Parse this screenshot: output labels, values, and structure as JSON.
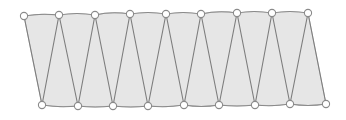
{
  "figure": {
    "canvas": {
      "width": 346,
      "height": 120,
      "background": "#ffffff"
    },
    "colors": {
      "fill": "#e6e6e6",
      "fill_edge": "#b5b5b5",
      "chord_stroke": "#8a8a8a",
      "web_stroke": "#7d7d7d",
      "node_stroke": "#8a8a8a",
      "node_fill": "#ffffff"
    },
    "style": {
      "chord_width": 1.1,
      "web_width": 1.1,
      "node_radius": 3.6,
      "node_stroke_width": 1.1
    },
    "counts": {
      "top_nodes": 9,
      "bottom_nodes": 9,
      "web_members": 17,
      "top_chord_segments": 8,
      "bottom_chord_segments": 8
    },
    "top_nodes": [
      {
        "id": "T1",
        "x": 24,
        "y": 16
      },
      {
        "id": "T2",
        "x": 59,
        "y": 15
      },
      {
        "id": "T3",
        "x": 95,
        "y": 15
      },
      {
        "id": "T4",
        "x": 130,
        "y": 14
      },
      {
        "id": "T5",
        "x": 166,
        "y": 14
      },
      {
        "id": "T6",
        "x": 201,
        "y": 14
      },
      {
        "id": "T7",
        "x": 237,
        "y": 13
      },
      {
        "id": "T8",
        "x": 272,
        "y": 13
      },
      {
        "id": "T9",
        "x": 308,
        "y": 13
      }
    ],
    "bottom_nodes": [
      {
        "id": "B1",
        "x": 42,
        "y": 105
      },
      {
        "id": "B2",
        "x": 78,
        "y": 106
      },
      {
        "id": "B3",
        "x": 113,
        "y": 106
      },
      {
        "id": "B4",
        "x": 148,
        "y": 106
      },
      {
        "id": "B5",
        "x": 184,
        "y": 105
      },
      {
        "id": "B6",
        "x": 219,
        "y": 105
      },
      {
        "id": "B7",
        "x": 255,
        "y": 105
      },
      {
        "id": "B8",
        "x": 290,
        "y": 104
      },
      {
        "id": "B9",
        "x": 326,
        "y": 104
      }
    ],
    "top_chord_path": "M 24 16 Q 41 13 59 15 Q 77 12 95 15 Q 112 11 130 14 Q 148 11 166 14 Q 183 11 201 14 Q 219 10 237 13 Q 254 10 272 13 Q 290 10 308 13",
    "bottom_chord_path": "M 42 105 Q 60 108 78 106 Q 95 108 113 106 Q 131 108 148 106 Q 166 108 184 105 Q 201 108 219 105 Q 237 107 255 105 Q 272 107 290 104 Q 308 107 326 104",
    "body_fill_path": "M 24 16 Q 41 13 59 15 Q 77 12 95 15 Q 112 11 130 14 Q 148 11 166 14 Q 183 11 201 14 Q 219 10 237 13 Q 254 10 272 13 Q 290 10 308 13 L 326 104 Q 308 107 290 104 Q 272 107 255 105 Q 237 107 219 105 Q 201 108 184 105 Q 166 108 148 106 Q 131 108 113 106 Q 95 108 78 106 Q 60 108 42 105 Z",
    "web_members": [
      {
        "id": "W1",
        "from": "T1",
        "to": "B1",
        "x1": 24,
        "y1": 16,
        "x2": 42,
        "y2": 105
      },
      {
        "id": "W2",
        "from": "T2",
        "to": "B1",
        "x1": 59,
        "y1": 15,
        "x2": 42,
        "y2": 105
      },
      {
        "id": "W3",
        "from": "T2",
        "to": "B2",
        "x1": 59,
        "y1": 15,
        "x2": 78,
        "y2": 106
      },
      {
        "id": "W4",
        "from": "T3",
        "to": "B2",
        "x1": 95,
        "y1": 15,
        "x2": 78,
        "y2": 106
      },
      {
        "id": "W5",
        "from": "T3",
        "to": "B3",
        "x1": 95,
        "y1": 15,
        "x2": 113,
        "y2": 106
      },
      {
        "id": "W6",
        "from": "T4",
        "to": "B3",
        "x1": 130,
        "y1": 14,
        "x2": 113,
        "y2": 106
      },
      {
        "id": "W7",
        "from": "T4",
        "to": "B4",
        "x1": 130,
        "y1": 14,
        "x2": 148,
        "y2": 106
      },
      {
        "id": "W8",
        "from": "T5",
        "to": "B4",
        "x1": 166,
        "y1": 14,
        "x2": 148,
        "y2": 106
      },
      {
        "id": "W9",
        "from": "T5",
        "to": "B5",
        "x1": 166,
        "y1": 14,
        "x2": 184,
        "y2": 105
      },
      {
        "id": "W10",
        "from": "T6",
        "to": "B5",
        "x1": 201,
        "y1": 14,
        "x2": 184,
        "y2": 105
      },
      {
        "id": "W11",
        "from": "T6",
        "to": "B6",
        "x1": 201,
        "y1": 14,
        "x2": 219,
        "y2": 105
      },
      {
        "id": "W12",
        "from": "T7",
        "to": "B6",
        "x1": 237,
        "y1": 13,
        "x2": 219,
        "y2": 105
      },
      {
        "id": "W13",
        "from": "T7",
        "to": "B7",
        "x1": 237,
        "y1": 13,
        "x2": 255,
        "y2": 105
      },
      {
        "id": "W14",
        "from": "T8",
        "to": "B7",
        "x1": 272,
        "y1": 13,
        "x2": 255,
        "y2": 105
      },
      {
        "id": "W15",
        "from": "T8",
        "to": "B8",
        "x1": 272,
        "y1": 13,
        "x2": 290,
        "y2": 104
      },
      {
        "id": "W16",
        "from": "T9",
        "to": "B8",
        "x1": 308,
        "y1": 13,
        "x2": 290,
        "y2": 104
      },
      {
        "id": "W17",
        "from": "T9",
        "to": "B9",
        "x1": 308,
        "y1": 13,
        "x2": 326,
        "y2": 104
      }
    ]
  }
}
